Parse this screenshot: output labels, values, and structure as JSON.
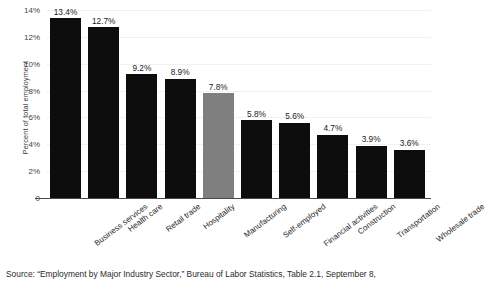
{
  "chart_data": {
    "type": "bar",
    "title": "",
    "xlabel": "",
    "ylabel": "Percent of total employment",
    "ylim": [
      0,
      14
    ],
    "grid": true,
    "legend": "none",
    "orientation": "vertical",
    "categories": [
      "Business services",
      "Health care",
      "Retail trade",
      "Hospitality",
      "Manufacturing",
      "Self-employed",
      "Financial activities",
      "Construction",
      "Transportation",
      "Wholesale trade"
    ],
    "values": [
      13.4,
      12.7,
      9.2,
      8.9,
      7.8,
      5.8,
      5.6,
      4.7,
      3.9,
      3.6
    ],
    "value_labels": [
      "13.4%",
      "12.7%",
      "9.2%",
      "8.9%",
      "7.8%",
      "5.8%",
      "5.6%",
      "4.7%",
      "3.9%",
      "3.6%"
    ],
    "bar_colors": [
      "#0d0d0d",
      "#0d0d0d",
      "#0d0d0d",
      "#0d0d0d",
      "#7f7f7f",
      "#0d0d0d",
      "#0d0d0d",
      "#0d0d0d",
      "#0d0d0d",
      "#0d0d0d"
    ],
    "highlighted_category": "Manufacturing",
    "yticks": [
      0,
      2,
      4,
      6,
      8,
      10,
      12,
      14
    ],
    "ytick_labels": [
      "0",
      "2%",
      "4%",
      "6%",
      "8%",
      "10%",
      "12%",
      "14%"
    ],
    "gridline_color": "#f1f1f1",
    "axis_color": "#4a4a4a",
    "background_color": "#ffffff"
  },
  "source": {
    "text": "Source: “Employment by Major Industry Sector,” Bureau of Labor Statistics, Table 2.1, September 8,"
  }
}
